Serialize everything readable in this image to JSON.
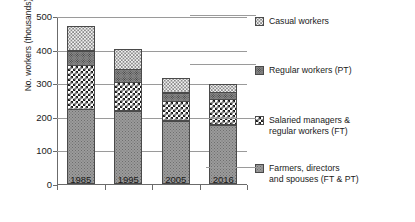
{
  "chart_data": {
    "type": "bar",
    "subtype": "stacked-bar",
    "title": "",
    "xlabel": "",
    "ylabel": "No. workers (thousands)",
    "categories": [
      "1985",
      "1995",
      "2005",
      "2016"
    ],
    "ylim": [
      0,
      500
    ],
    "yticks": [
      0,
      100,
      200,
      300,
      400,
      500
    ],
    "ytick_labels": [
      "0",
      "100",
      "200",
      "300",
      "400",
      "500"
    ],
    "grid": true,
    "legend_position": "right",
    "units": "thousands of workers",
    "series": [
      {
        "name": "Farmers, directors and spouses (FT & PT)",
        "legend_label": "Farmers, directors\nand spouses (FT & PT)",
        "pattern": "farmers",
        "color": "#9b9b9b",
        "values": [
          222,
          218,
          188,
          177
        ]
      },
      {
        "name": "Salaried managers & regular workers (FT)",
        "legend_label": "Salaried managers &\nregular workers (FT)",
        "pattern": "salaried",
        "color": "#1c1c1c",
        "values": [
          133,
          87,
          60,
          78
        ]
      },
      {
        "name": "Regular workers (PT)",
        "legend_label": "Regular workers (PT)",
        "pattern": "regularpt",
        "color": "#8d8d8d",
        "values": [
          45,
          40,
          27,
          22
        ]
      },
      {
        "name": "Casual workers",
        "legend_label": "Casual workers",
        "pattern": "casual",
        "color": "#f2f2f2",
        "values": [
          77,
          62,
          45,
          25
        ]
      }
    ],
    "totals": [
      477,
      407,
      320,
      302
    ],
    "cumulative_tops": {
      "1985": [
        222,
        355,
        400,
        477
      ],
      "1995": [
        218,
        305,
        345,
        407
      ],
      "2005": [
        188,
        248,
        275,
        320
      ],
      "2016": [
        177,
        255,
        277,
        302
      ]
    }
  },
  "axis": {
    "y_title": "No. workers (thousands)"
  }
}
